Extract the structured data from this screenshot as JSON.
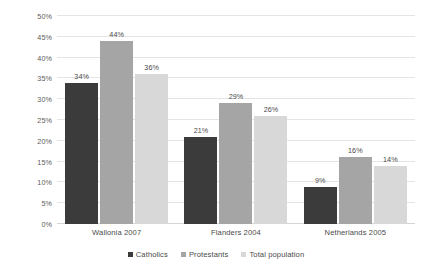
{
  "chart_data": {
    "type": "bar",
    "title": "",
    "subtitle": "",
    "xlabel": "",
    "ylabel": "",
    "categories": [
      "Wallonia 2007",
      "Flanders 2004",
      "Netherlands 2005"
    ],
    "series": [
      {
        "name": "Catholics",
        "values": [
          34,
          44,
          9
        ],
        "color": "#3b3b3b"
      },
      {
        "name": "Protestants",
        "values": [
          29,
          29,
          16
        ],
        "color": "#a5a5a5"
      },
      {
        "name": "Total population",
        "values": [
          36,
          26,
          14
        ],
        "color": "#d8d8d8"
      }
    ],
    "series_values_corrected": {
      "Catholics": [
        34,
        21,
        9
      ],
      "Protestants": [
        44,
        29,
        16
      ],
      "Total population": [
        36,
        26,
        14
      ]
    },
    "data_labels": [
      [
        "34%",
        "44%",
        "36%"
      ],
      [
        "21%",
        "29%",
        "26%"
      ],
      [
        "9%",
        "16%",
        "14%"
      ]
    ],
    "ylim": [
      0,
      50
    ],
    "ytick_values": [
      0,
      5,
      10,
      15,
      20,
      25,
      30,
      35,
      40,
      45,
      50
    ],
    "ytick_labels": [
      "0%",
      "5%",
      "10%",
      "15%",
      "20%",
      "25%",
      "30%",
      "35%",
      "40%",
      "45%",
      "50%"
    ],
    "grid": true,
    "grid_axis": "y",
    "legend_position": "bottom",
    "grid_color": "#e4e4e4",
    "background": "#ffffff",
    "label_color": "#4a4a4a"
  },
  "legend": {
    "items": [
      {
        "label": "Catholics",
        "color": "#3b3b3b"
      },
      {
        "label": "Protestants",
        "color": "#a5a5a5"
      },
      {
        "label": "Total population",
        "color": "#d8d8d8"
      }
    ]
  }
}
